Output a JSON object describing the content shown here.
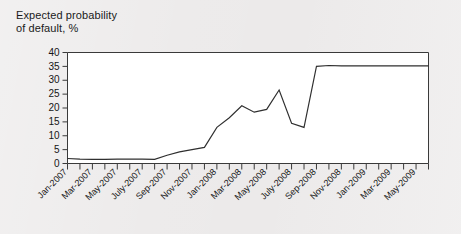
{
  "figure": {
    "background_color": "#eceaea",
    "plot_background_color": "#ffffff",
    "axis_color": "#3a3a3a",
    "line_color": "#2f2f2f"
  },
  "title_text": "Expected probability\nof default, %",
  "chart_data": {
    "type": "line",
    "title": "Expected probability of default, %",
    "xlabel": "",
    "ylabel": "",
    "ylim": [
      0,
      40
    ],
    "yticks": [
      0,
      5,
      10,
      15,
      20,
      25,
      30,
      35,
      40
    ],
    "ytick_labels": [
      "0",
      "5",
      "10",
      "15",
      "20",
      "25",
      "30",
      "35",
      "40"
    ],
    "grid": false,
    "legend": "none",
    "x_tick_labels": [
      "Jan-2007",
      "Mar-2007",
      "May-2007",
      "July-2007",
      "Sep-2007",
      "Nov-2007",
      "Jan-2008",
      "Mar-2008",
      "May-2008",
      "July-2008",
      "Sep-2008",
      "Nov-2008",
      "Jan-2009",
      "Mar-2009",
      "May-2009"
    ],
    "x": [
      "Jan-2007",
      "Feb-2007",
      "Mar-2007",
      "Apr-2007",
      "May-2007",
      "June-2007",
      "July-2007",
      "Aug-2007",
      "Sep-2007",
      "Oct-2007",
      "Nov-2007",
      "Dec-2007",
      "Jan-2008",
      "Feb-2008",
      "Mar-2008",
      "Apr-2008",
      "May-2008",
      "June-2008",
      "July-2008",
      "Aug-2008",
      "Sep-2008",
      "Oct-2008",
      "Nov-2008",
      "Dec-2008",
      "Jan-2009",
      "Feb-2009",
      "Mar-2009",
      "Apr-2009",
      "May-2009",
      "June-2009"
    ],
    "series": [
      {
        "name": "Expected probability of default",
        "values": [
          1.8,
          1.6,
          1.5,
          1.5,
          1.6,
          1.6,
          1.6,
          1.5,
          3.0,
          4.2,
          5.0,
          5.8,
          13.0,
          16.5,
          20.8,
          18.5,
          19.5,
          26.5,
          14.5,
          13.0,
          35.0,
          35.3,
          35.2,
          35.2,
          35.2,
          35.2,
          35.2,
          35.2,
          35.2,
          35.2
        ]
      }
    ]
  }
}
